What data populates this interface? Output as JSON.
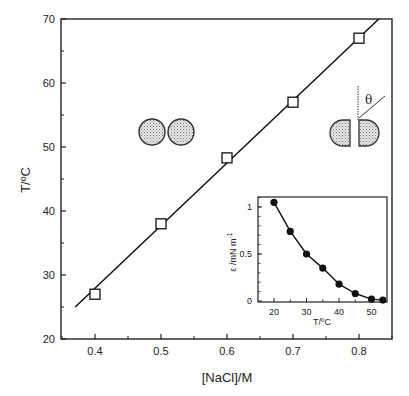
{
  "chart_data": [
    {
      "type": "scatter",
      "title": "",
      "xlabel": "[NaCl]/M",
      "ylabel": "T/°C",
      "xlim": [
        0.36,
        0.86
      ],
      "ylim": [
        20,
        70
      ],
      "x_ticks": [
        "0.4",
        "0.5",
        "0.6",
        "0.7",
        "0.8"
      ],
      "y_ticks": [
        "20",
        "30",
        "40",
        "50",
        "60",
        "70"
      ],
      "grid": false,
      "series": [
        {
          "name": "transition",
          "marker": "open-square",
          "x": [
            0.4,
            0.5,
            0.6,
            0.7,
            0.8
          ],
          "y": [
            27,
            38,
            48.3,
            57,
            67
          ]
        }
      ],
      "fit_line": {
        "x": [
          0.37,
          0.83
        ],
        "y": [
          25,
          70
        ]
      },
      "annotations": [
        "spherical droplet pair (lower-left region)",
        "flattened droplet pair with contact angle θ (upper-right region)"
      ]
    },
    {
      "type": "line",
      "title": "inset",
      "xlabel": "T/°C",
      "ylabel": "ε /mN m⁻¹",
      "xlim": [
        15,
        55
      ],
      "ylim": [
        0,
        1.1
      ],
      "x_ticks": [
        "20",
        "30",
        "40",
        "50"
      ],
      "y_ticks": [
        "0",
        "0.5",
        "1"
      ],
      "series": [
        {
          "name": "binding energy",
          "marker": "filled-circle",
          "x": [
            20,
            25,
            30,
            35,
            40,
            45,
            50,
            53.5
          ],
          "y": [
            1.05,
            0.74,
            0.5,
            0.35,
            0.18,
            0.08,
            0.02,
            0.01
          ]
        }
      ]
    }
  ],
  "labels": {
    "main_x": "[NaCl]/M",
    "main_y": "T/ºC",
    "inset_x": "T/ºC",
    "inset_y": "ε /mN m",
    "inset_y_sup": "-1",
    "theta": "θ"
  }
}
